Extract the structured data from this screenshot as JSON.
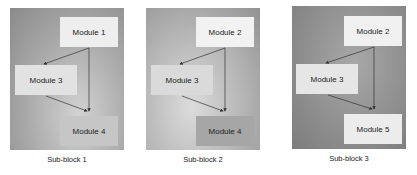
{
  "panels": [
    {
      "caption": "Sub-block 1",
      "modules": [
        {
          "id": "top",
          "label": "Module 1"
        },
        {
          "id": "left",
          "label": "Module 3"
        },
        {
          "id": "bottom",
          "label": "Module 4"
        }
      ]
    },
    {
      "caption": "Sub-block 2",
      "modules": [
        {
          "id": "top",
          "label": "Module 2"
        },
        {
          "id": "left",
          "label": "Module 3"
        },
        {
          "id": "bottom",
          "label": "Module 4"
        }
      ]
    },
    {
      "caption": "Sub-block 3",
      "modules": [
        {
          "id": "top",
          "label": "Module 2"
        },
        {
          "id": "left",
          "label": "Module 3"
        },
        {
          "id": "bottom",
          "label": "Module 5"
        }
      ]
    }
  ],
  "colors": {
    "panel_dark": "#8c8c8c",
    "panel_light": "#c8c8c8",
    "module_box": "#ececec",
    "arrow": "#333333"
  }
}
